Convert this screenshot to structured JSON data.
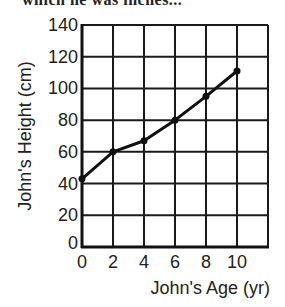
{
  "header_fragment": "which he was inches...",
  "chart_data": {
    "type": "line",
    "title": "",
    "xlabel": "John's Age (yr)",
    "ylabel": "John's Height (cm)",
    "x": [
      0,
      2,
      4,
      6,
      8,
      10
    ],
    "series": [
      {
        "name": "John's Height",
        "values": [
          43,
          60,
          67,
          80,
          95,
          111
        ]
      }
    ],
    "xlim": [
      0,
      12
    ],
    "ylim": [
      0,
      140
    ],
    "x_ticks": [
      "0",
      "2",
      "4",
      "6",
      "8",
      "10"
    ],
    "y_ticks": [
      "0",
      "20",
      "40",
      "60",
      "80",
      "100",
      "120",
      "140"
    ],
    "grid": true,
    "legend": "none"
  }
}
